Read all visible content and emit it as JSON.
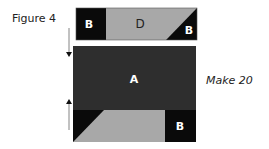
{
  "figure_label": "Figure 4",
  "make_label": "Make 20",
  "pieces": {
    "top_strip": {
      "left_label": "B",
      "middle_label": "D",
      "right_label": "B"
    },
    "center": {
      "label": "A"
    },
    "bottom_strip": {
      "right_label": "B"
    }
  },
  "colors": {
    "black": "#0a0a0a",
    "dark": "#2e2e2e",
    "gray": "#a8a8a8"
  }
}
